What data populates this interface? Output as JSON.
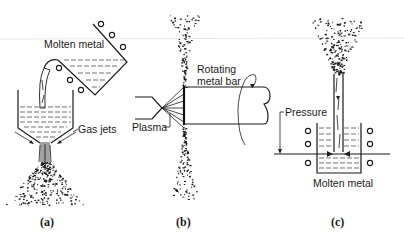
{
  "figure": {
    "panels": [
      {
        "id": "a",
        "caption": "(a)",
        "labels": {
          "molten_metal": "Molten metal",
          "gas_jets": "Gas jets"
        }
      },
      {
        "id": "b",
        "caption": "(b)",
        "labels": {
          "rotating_bar_line1": "Rotating",
          "rotating_bar_line2": "metal bar",
          "plasma": "Plasma"
        }
      },
      {
        "id": "c",
        "caption": "(c)",
        "labels": {
          "pressure": "Pressure",
          "molten_metal": "Molten metal"
        }
      }
    ]
  }
}
